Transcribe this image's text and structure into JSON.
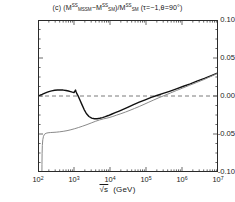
{
  "figure": {
    "panel_label": "(c)",
    "title_plain": "(c) (M^SS_MSSM - M^SS_SM)/M^SS_SM  (τ=-1,θ=90°)",
    "xaxis_title_symbol": "√s",
    "xaxis_title_units": "(GeV)",
    "background_color": "#ffffff",
    "frame_color": "#2a2a2a"
  },
  "title_parts": {
    "panel": "(c)",
    "open": "(M",
    "num_sup1": "SS",
    "num_sub1": "MSSM",
    "minus": "−M",
    "num_sup2": "SS",
    "num_sub2": "SM",
    "divider": ")/M",
    "den_sup": "SS",
    "den_sub": "SM",
    "params": "(τ=−1,θ=90°)"
  },
  "chart_data": {
    "type": "line",
    "xlabel": "√s (GeV)",
    "ylabel": "",
    "xscale": "log",
    "xlim": [
      100,
      10000000
    ],
    "ylim": [
      -0.1,
      0.1
    ],
    "grid": false,
    "legend": "none",
    "ytick_labels": [
      "0.10",
      "0.05",
      "0.00",
      "-0.05",
      "-0.10"
    ],
    "ytick_values": [
      0.1,
      0.05,
      0.0,
      -0.05,
      -0.1
    ],
    "xtick_labels": [
      "10",
      "10",
      "10",
      "10",
      "10",
      "10"
    ],
    "xtick_exponents": [
      "2",
      "3",
      "4",
      "5",
      "6",
      "7"
    ],
    "xtick_values": [
      100,
      1000,
      10000,
      100000,
      1000000,
      10000000
    ],
    "annotations": [
      {
        "name": "zero-reference-line",
        "type": "hline",
        "y": 0.0,
        "style": "dashed",
        "color": "#6b6b6b"
      }
    ],
    "series": [
      {
        "name": "black-curve",
        "color": "#111111",
        "width": 1.4,
        "style": "solid",
        "x": [
          100,
          115,
          130,
          150,
          175,
          200,
          240,
          290,
          350,
          420,
          500,
          600,
          700,
          800,
          900,
          1000,
          1050,
          1100,
          1150,
          1200,
          1300,
          1450,
          1650,
          1900,
          2200,
          2600,
          3100,
          3700,
          4400,
          5200,
          6200,
          7400,
          9000,
          11000,
          14000,
          18000,
          24000,
          32000,
          45000,
          65000,
          95000,
          140000,
          200000,
          300000,
          450000,
          700000,
          1100000,
          1700000,
          2600000,
          4200000,
          6800000,
          10000000
        ],
        "y": [
          0.0005,
          0.0012,
          0.0022,
          0.0035,
          0.0048,
          0.0058,
          0.0068,
          0.0075,
          0.0079,
          0.008,
          0.0078,
          0.0073,
          0.0066,
          0.0058,
          0.005,
          0.0044,
          0.0062,
          0.0078,
          0.0052,
          0.003,
          0.0002,
          -0.005,
          -0.011,
          -0.0175,
          -0.023,
          -0.027,
          -0.0292,
          -0.03,
          -0.0299,
          -0.0293,
          -0.0284,
          -0.0272,
          -0.0257,
          -0.024,
          -0.022,
          -0.0198,
          -0.0172,
          -0.0145,
          -0.0114,
          -0.0082,
          -0.005,
          -0.0018,
          0.0006,
          0.0034,
          0.0062,
          0.0094,
          0.0128,
          0.016,
          0.0195,
          0.0232,
          0.0272,
          0.0305
        ]
      },
      {
        "name": "gray-curve",
        "color": "#8a8a8a",
        "width": 1.0,
        "style": "solid",
        "x": [
          128,
          129,
          130,
          132,
          136,
          142,
          152,
          168,
          190,
          220,
          260,
          320,
          400,
          500,
          640,
          820,
          1050,
          1350,
          1750,
          2300,
          3000,
          3900,
          5100,
          6700,
          8800,
          11500,
          15000,
          20000,
          27000,
          36000,
          48000,
          65000,
          88000,
          120000,
          165000,
          230000,
          330000,
          480000,
          700000,
          1050000,
          1600000,
          2500000,
          4000000,
          6400000,
          10000000
        ],
        "y": [
          -0.11,
          -0.09,
          -0.076,
          -0.065,
          -0.0575,
          -0.053,
          -0.0503,
          -0.049,
          -0.0484,
          -0.0481,
          -0.0479,
          -0.0476,
          -0.0471,
          -0.0465,
          -0.0456,
          -0.0444,
          -0.043,
          -0.0414,
          -0.0396,
          -0.0376,
          -0.0355,
          -0.0334,
          -0.0315,
          -0.03,
          -0.0288,
          -0.0272,
          -0.0253,
          -0.0233,
          -0.0211,
          -0.0188,
          -0.0164,
          -0.0138,
          -0.011,
          -0.0081,
          -0.0052,
          -0.0022,
          0.0008,
          0.004,
          0.0072,
          0.0105,
          0.014,
          0.0176,
          0.0215,
          0.0258,
          0.03
        ]
      }
    ]
  }
}
